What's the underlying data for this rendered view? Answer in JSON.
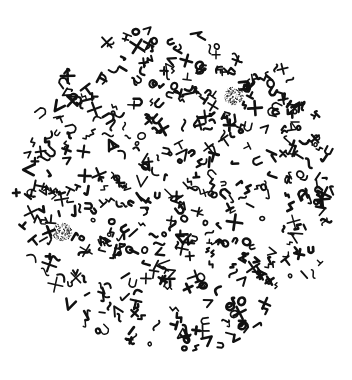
{
  "figure": {
    "background": "#ffffff",
    "ink": "#111111",
    "field": {
      "cx": 176,
      "cy": 190,
      "rx": 160,
      "ry": 164
    },
    "chromosome_count_approx": 520,
    "centrosomes": [
      {
        "cx": 234,
        "cy": 96,
        "r": 10
      },
      {
        "cx": 62,
        "cy": 232,
        "r": 10
      }
    ],
    "clear_regions": [
      {
        "cx": 118,
        "cy": 88,
        "r": 14
      },
      {
        "cx": 170,
        "cy": 120,
        "r": 12
      },
      {
        "cx": 262,
        "cy": 208,
        "r": 10
      },
      {
        "cx": 310,
        "cy": 300,
        "r": 22
      }
    ]
  }
}
